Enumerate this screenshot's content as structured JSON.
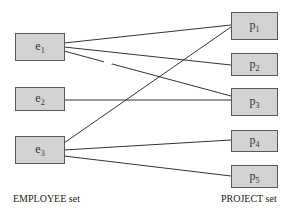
{
  "diagram": {
    "employees": [
      {
        "id": "e1",
        "base": "e",
        "sub": "1"
      },
      {
        "id": "e2",
        "base": "e",
        "sub": "2"
      },
      {
        "id": "e3",
        "base": "e",
        "sub": "3"
      }
    ],
    "projects": [
      {
        "id": "p1",
        "base": "p",
        "sub": "1"
      },
      {
        "id": "p2",
        "base": "p",
        "sub": "2"
      },
      {
        "id": "p3",
        "base": "p",
        "sub": "3"
      },
      {
        "id": "p4",
        "base": "p",
        "sub": "4"
      },
      {
        "id": "p5",
        "base": "p",
        "sub": "5"
      }
    ],
    "relationships": [
      {
        "from": "e1",
        "to": "p1"
      },
      {
        "from": "e1",
        "to": "p2"
      },
      {
        "from": "e1",
        "to": "p3"
      },
      {
        "from": "e2",
        "to": "p3"
      },
      {
        "from": "e3",
        "to": "p1"
      },
      {
        "from": "e3",
        "to": "p4"
      },
      {
        "from": "e3",
        "to": "p5"
      }
    ],
    "employee_set_label": "EMPLOYEE set",
    "project_set_label": "PROJECT set",
    "colors": {
      "node_fill": "#d3d3d3",
      "node_border": "#5a5a5a",
      "line": "#333333"
    }
  }
}
